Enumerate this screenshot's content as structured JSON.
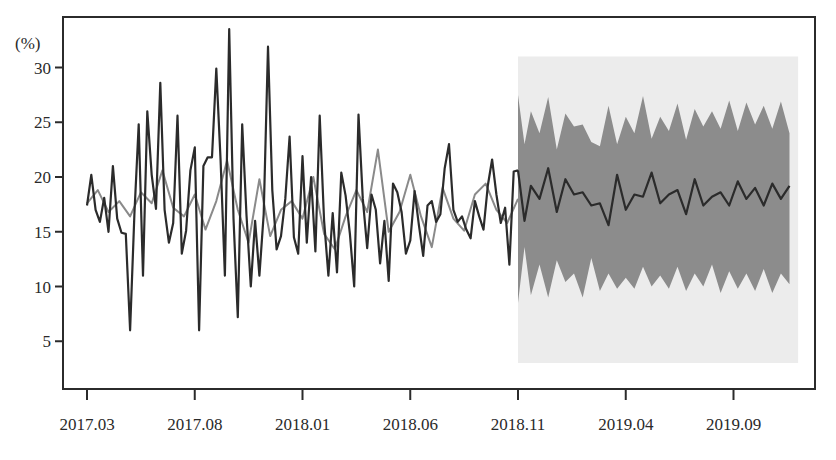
{
  "chart_data": {
    "type": "line",
    "title": "",
    "xlabel": "",
    "ylabel": "(%)",
    "ylim": [
      1.5,
      33.5
    ],
    "yticks": [
      5,
      10,
      15,
      20,
      25,
      30
    ],
    "ytick_labels": [
      "5",
      "10",
      "15",
      "20",
      "25",
      "30"
    ],
    "xtick_labels": [
      "2017.03",
      "2017.08",
      "2018.01",
      "2018.06",
      "2018.11",
      "2019.04",
      "2019.09"
    ],
    "grid": false,
    "legend": "none",
    "x_unit": "month index from 2017.03 (0 = 2017.03, 20 = 2018.11, 30 = 2019.09)",
    "series": [
      {
        "name": "actual",
        "color": "#2b2b2b",
        "x": [
          0,
          0.2,
          0.4,
          0.6,
          0.8,
          1.0,
          1.2,
          1.4,
          1.6,
          1.8,
          2.0,
          2.2,
          2.4,
          2.6,
          2.8,
          3.0,
          3.2,
          3.4,
          3.6,
          3.8,
          4.0,
          4.2,
          4.4,
          4.6,
          4.8,
          5.0,
          5.2,
          5.4,
          5.6,
          5.8,
          6.0,
          6.2,
          6.4,
          6.6,
          6.8,
          7.0,
          7.2,
          7.4,
          7.6,
          7.8,
          8.0,
          8.2,
          8.4,
          8.6,
          8.8,
          9.0,
          9.2,
          9.4,
          9.6,
          9.8,
          10.0,
          10.2,
          10.4,
          10.6,
          10.8,
          11.0,
          11.2,
          11.4,
          11.6,
          11.8,
          12.0,
          12.2,
          12.4,
          12.6,
          12.8,
          13.0,
          13.2,
          13.4,
          13.6,
          13.8,
          14.0,
          14.2,
          14.4,
          14.6,
          14.8,
          15.0,
          15.2,
          15.4,
          15.6,
          15.8,
          16.0,
          16.2,
          16.4,
          16.6,
          16.8,
          17.0,
          17.2,
          17.4,
          17.6,
          17.8,
          18.0,
          18.2,
          18.4,
          18.6,
          18.8,
          19.0,
          19.2,
          19.4,
          19.6,
          19.8,
          20.0
        ],
        "values": [
          17.4,
          20.2,
          17.0,
          15.9,
          18.1,
          15.0,
          21.0,
          16.2,
          14.9,
          14.8,
          6.0,
          16.6,
          24.8,
          11.0,
          26.0,
          20.2,
          17.1,
          28.6,
          17.0,
          14.0,
          15.8,
          25.6,
          13.0,
          15.1,
          20.6,
          22.7,
          6.0,
          21.0,
          21.8,
          21.8,
          29.9,
          21.5,
          11.0,
          33.5,
          16.2,
          7.2,
          24.8,
          16.5,
          10.0,
          16.0,
          11.0,
          16.6,
          31.9,
          18.8,
          13.4,
          14.6,
          18.0,
          23.7,
          14.5,
          13.0,
          21.9,
          14.0,
          20.0,
          13.2,
          25.6,
          16.0,
          11.0,
          16.7,
          11.3,
          20.4,
          18.3,
          14.8,
          10.0,
          25.7,
          18.0,
          13.5,
          18.4,
          17.0,
          12.1,
          16.0,
          10.5,
          19.4,
          18.6,
          16.8,
          13.0,
          14.2,
          18.7,
          15.6,
          12.8,
          17.4,
          17.8,
          15.9,
          16.6,
          20.8,
          23.0,
          17.0,
          15.9,
          16.4,
          15.2,
          14.4,
          17.8,
          16.4,
          15.2,
          19.2,
          21.6,
          18.4,
          15.8,
          17.2,
          12.0,
          20.5,
          20.6
        ]
      },
      {
        "name": "fitted",
        "color": "#8a8a8a",
        "x": [
          0,
          0.5,
          1.0,
          1.5,
          2.0,
          2.5,
          3.0,
          3.5,
          4.0,
          4.5,
          5.0,
          5.5,
          6.0,
          6.5,
          7.0,
          7.5,
          8.0,
          8.5,
          9.0,
          9.5,
          10.0,
          10.5,
          11.0,
          11.5,
          12.0,
          12.5,
          13.0,
          13.5,
          14.0,
          14.5,
          15.0,
          15.5,
          16.0,
          16.5,
          17.0,
          17.5,
          18.0,
          18.5,
          19.0,
          19.5,
          20.0
        ],
        "values": [
          17.6,
          18.8,
          16.8,
          17.8,
          16.4,
          18.6,
          17.6,
          20.6,
          17.2,
          16.4,
          18.4,
          15.2,
          17.8,
          21.5,
          17.0,
          14.0,
          19.8,
          14.6,
          17.0,
          17.8,
          16.2,
          20.0,
          14.8,
          13.4,
          16.4,
          18.8,
          16.8,
          22.5,
          15.0,
          16.8,
          20.2,
          16.4,
          13.6,
          19.0,
          16.2,
          15.1,
          18.4,
          19.4,
          17.0,
          15.8,
          18.0
        ]
      },
      {
        "name": "forecast",
        "color": "#2b2b2b",
        "x": [
          20.0,
          20.3,
          20.6,
          21.0,
          21.4,
          21.8,
          22.2,
          22.6,
          23.0,
          23.4,
          23.8,
          24.2,
          24.6,
          25.0,
          25.4,
          25.8,
          26.2,
          26.6,
          27.0,
          27.4,
          27.8,
          28.2,
          28.6,
          29.0,
          29.4,
          29.8,
          30.2,
          30.6,
          31.0,
          31.4,
          31.8,
          32.2,
          32.6
        ],
        "values": [
          20.6,
          16.0,
          19.2,
          18.0,
          20.8,
          16.8,
          19.8,
          18.4,
          18.6,
          17.4,
          17.6,
          15.6,
          20.2,
          17.0,
          18.4,
          18.2,
          20.4,
          17.6,
          18.4,
          18.8,
          16.6,
          19.8,
          17.4,
          18.2,
          18.6,
          17.4,
          19.6,
          18.0,
          19.0,
          17.4,
          19.4,
          18.0,
          19.2
        ]
      }
    ],
    "bands": [
      {
        "name": "95% interval",
        "color": "#ececec",
        "x": [
          20.0,
          33.0
        ],
        "upper": [
          31.0,
          31.0
        ],
        "lower": [
          3.0,
          3.0
        ]
      },
      {
        "name": "80% interval",
        "color": "#8c8c8c",
        "x": [
          20.0,
          20.3,
          20.6,
          21.0,
          21.4,
          21.8,
          22.2,
          22.6,
          23.0,
          23.4,
          23.8,
          24.2,
          24.6,
          25.0,
          25.4,
          25.8,
          26.2,
          26.6,
          27.0,
          27.4,
          27.8,
          28.2,
          28.6,
          29.0,
          29.4,
          29.8,
          30.2,
          30.6,
          31.0,
          31.4,
          31.8,
          32.2,
          32.6
        ],
        "upper": [
          27.5,
          23.0,
          26.0,
          24.0,
          27.3,
          22.5,
          25.8,
          24.6,
          24.8,
          23.2,
          22.8,
          26.5,
          23.0,
          25.5,
          24.0,
          27.4,
          23.5,
          25.5,
          24.2,
          26.7,
          23.4,
          26.2,
          24.6,
          26.0,
          24.4,
          27.0,
          24.2,
          26.8,
          24.8,
          26.5,
          24.4,
          26.9,
          24.0
        ],
        "lower": [
          8.5,
          13.6,
          9.2,
          12.0,
          9.0,
          12.4,
          10.4,
          11.2,
          9.0,
          12.6,
          9.6,
          11.2,
          9.8,
          10.8,
          9.8,
          11.8,
          10.0,
          11.0,
          9.8,
          11.8,
          9.6,
          11.2,
          10.0,
          12.0,
          9.4,
          11.4,
          9.8,
          11.2,
          9.6,
          11.6,
          9.4,
          11.2,
          10.2
        ]
      }
    ]
  },
  "axes": {
    "y_unit_label": "(%)",
    "y_ticks": [
      {
        "label": "30",
        "value": 30
      },
      {
        "label": "25",
        "value": 25
      },
      {
        "label": "20",
        "value": 20
      },
      {
        "label": "15",
        "value": 15
      },
      {
        "label": "10",
        "value": 10
      },
      {
        "label": "5",
        "value": 5
      }
    ],
    "x_ticks": [
      {
        "label": "2017.03",
        "month": 0
      },
      {
        "label": "2017.08",
        "month": 5
      },
      {
        "label": "2018.01",
        "month": 10
      },
      {
        "label": "2018.06",
        "month": 15
      },
      {
        "label": "2018.11",
        "month": 20
      },
      {
        "label": "2019.04",
        "month": 25
      },
      {
        "label": "2019.09",
        "month": 30
      }
    ]
  }
}
